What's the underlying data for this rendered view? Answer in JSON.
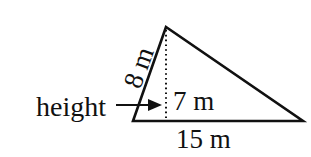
{
  "diagram": {
    "type": "triangle",
    "labels": {
      "side_left": "8 m",
      "height_value": "7 m",
      "base": "15 m",
      "height_word": "height"
    },
    "colors": {
      "stroke": "#111111",
      "background": "#ffffff"
    }
  }
}
